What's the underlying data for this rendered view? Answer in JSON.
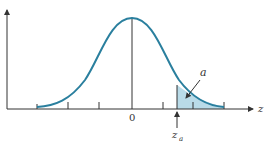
{
  "diagram": {
    "type": "normal-distribution-upper-tail",
    "labels": {
      "center_tick": "0",
      "x_axis": "z",
      "critical_value": "z",
      "critical_value_subscript": "a",
      "tail_area": "a"
    },
    "colors": {
      "curve": "#2a7f9e",
      "shade": "#b9dbe8",
      "axis": "#333333"
    }
  }
}
